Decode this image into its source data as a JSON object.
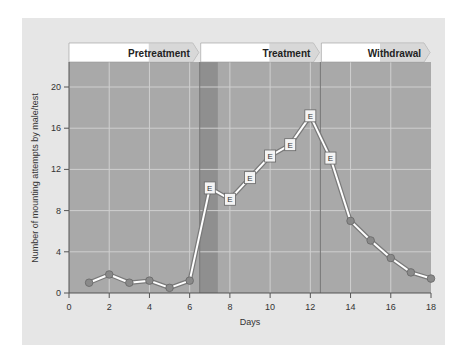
{
  "chart_data": {
    "type": "line",
    "title": "",
    "xlabel": "Days",
    "ylabel": "Number of mounting attempts by male/test",
    "xlim": [
      0,
      18
    ],
    "ylim": [
      0,
      22
    ],
    "x_ticks": [
      0,
      2,
      4,
      6,
      8,
      10,
      12,
      14,
      16,
      18
    ],
    "y_ticks": [
      0,
      4,
      8,
      12,
      16,
      20
    ],
    "grid": true,
    "phases": [
      {
        "name": "Pretreatment",
        "start": 0,
        "end": 6.5
      },
      {
        "name": "Treatment",
        "start": 6.5,
        "end": 12.5
      },
      {
        "name": "Withdrawal",
        "start": 12.5,
        "end": 18
      }
    ],
    "highlight_band": {
      "start": 6.5,
      "end": 7.4
    },
    "marker_legend": {
      "E": "Estrogen-treated test day"
    },
    "series": [
      {
        "name": "Mounting attempts",
        "x": [
          1,
          2,
          3,
          4,
          5,
          6,
          7,
          8,
          9,
          10,
          11,
          12,
          13,
          14,
          15,
          16,
          17,
          18
        ],
        "values": [
          1.0,
          1.8,
          1.0,
          1.2,
          0.5,
          1.2,
          10.2,
          9.1,
          11.2,
          13.3,
          14.4,
          17.2,
          13.1,
          7.0,
          5.1,
          3.4,
          2.0,
          1.4
        ],
        "markers": [
          "circle",
          "circle",
          "circle",
          "circle",
          "circle",
          "circle",
          "E",
          "E",
          "E",
          "E",
          "E",
          "E",
          "E",
          "circle",
          "circle",
          "circle",
          "circle",
          "circle"
        ]
      }
    ]
  },
  "colors": {
    "panel_bg": "#e6e6e6",
    "plot_bg": "#a9a9a9",
    "highlight_band": "#8f8f8f",
    "grid": "#cfcfcf",
    "header_bg": "#ffffff",
    "header_arrow": "#c8c8c8",
    "line_outer": "#7a7a7a",
    "line_inner": "#ffffff",
    "marker_fill": "#8a8a8a"
  }
}
